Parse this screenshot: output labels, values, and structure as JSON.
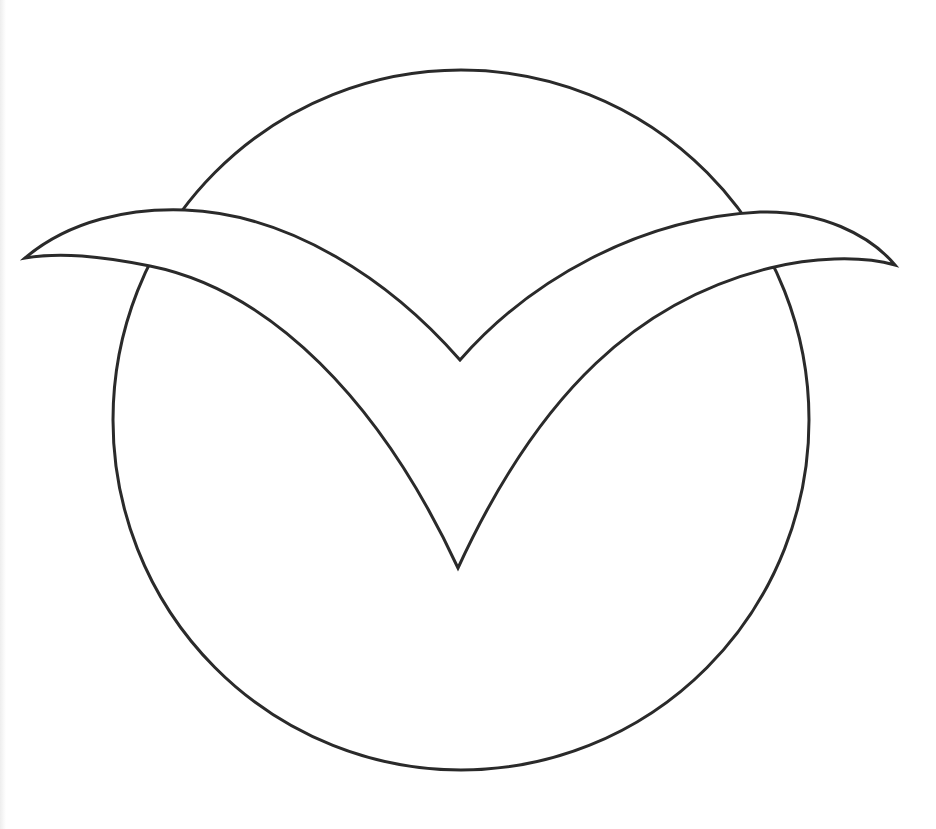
{
  "drawing": {
    "subject": "gull-over-circle-line-art",
    "stroke_color": "#2a2a2a",
    "background_color": "#ffffff",
    "stroke_width": 3,
    "circle": {
      "cx": 461,
      "cy": 420,
      "rx": 348,
      "ry": 350
    },
    "bird": {
      "outline_path": "M 25 258 C 70 220 130 208 185 210 C 290 214 390 280 460 360 C 530 280 640 218 760 212 C 820 210 870 235 895 265 C 860 255 810 258 770 268 C 640 300 540 390 458 568 C 380 400 270 290 150 266 C 100 256 60 252 25 258 Z"
    }
  }
}
